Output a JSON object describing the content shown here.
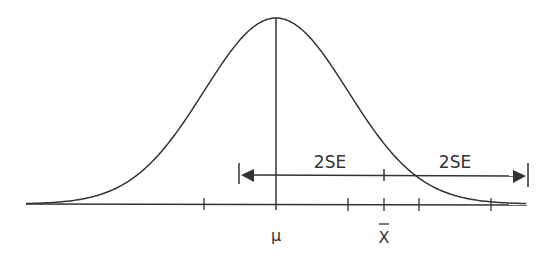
{
  "diagram": {
    "type": "normal-distribution-confidence-interval",
    "labels": {
      "mean": "μ",
      "sample_mean": "X",
      "left_span": "2SE",
      "right_span": "2SE"
    },
    "colors": {
      "stroke": "#333333",
      "background": "#ffffff"
    }
  }
}
